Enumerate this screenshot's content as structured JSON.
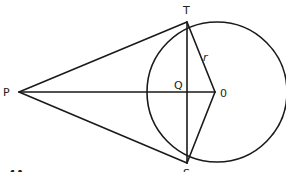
{
  "diagram": {
    "stroke_color": "#1a1a1a",
    "background": "#ffffff",
    "circle": {
      "cx": 217,
      "cy": 92,
      "r": 70,
      "label_center": "0"
    },
    "points": {
      "P": {
        "x": 19,
        "y": 92,
        "label": "P"
      },
      "T": {
        "x": 187,
        "y": 22,
        "label": "T"
      },
      "S": {
        "x": 187,
        "y": 163,
        "label": "S"
      },
      "Q": {
        "x": 187,
        "y": 92,
        "label": "Q"
      },
      "O": {
        "x": 215,
        "y": 92,
        "label": "0"
      }
    },
    "segments": [
      {
        "from": "P",
        "to": "T",
        "name": "tangent-PT"
      },
      {
        "from": "P",
        "to": "S",
        "name": "tangent-PS"
      },
      {
        "from": "P",
        "to": "O",
        "name": "line-PO"
      },
      {
        "from": "T",
        "to": "S",
        "name": "chord-TS"
      },
      {
        "from": "T",
        "to": "O",
        "name": "radius-TO"
      },
      {
        "from": "S",
        "to": "O",
        "name": "radius-SO"
      }
    ],
    "radius_label": "r",
    "caption": "4A"
  }
}
